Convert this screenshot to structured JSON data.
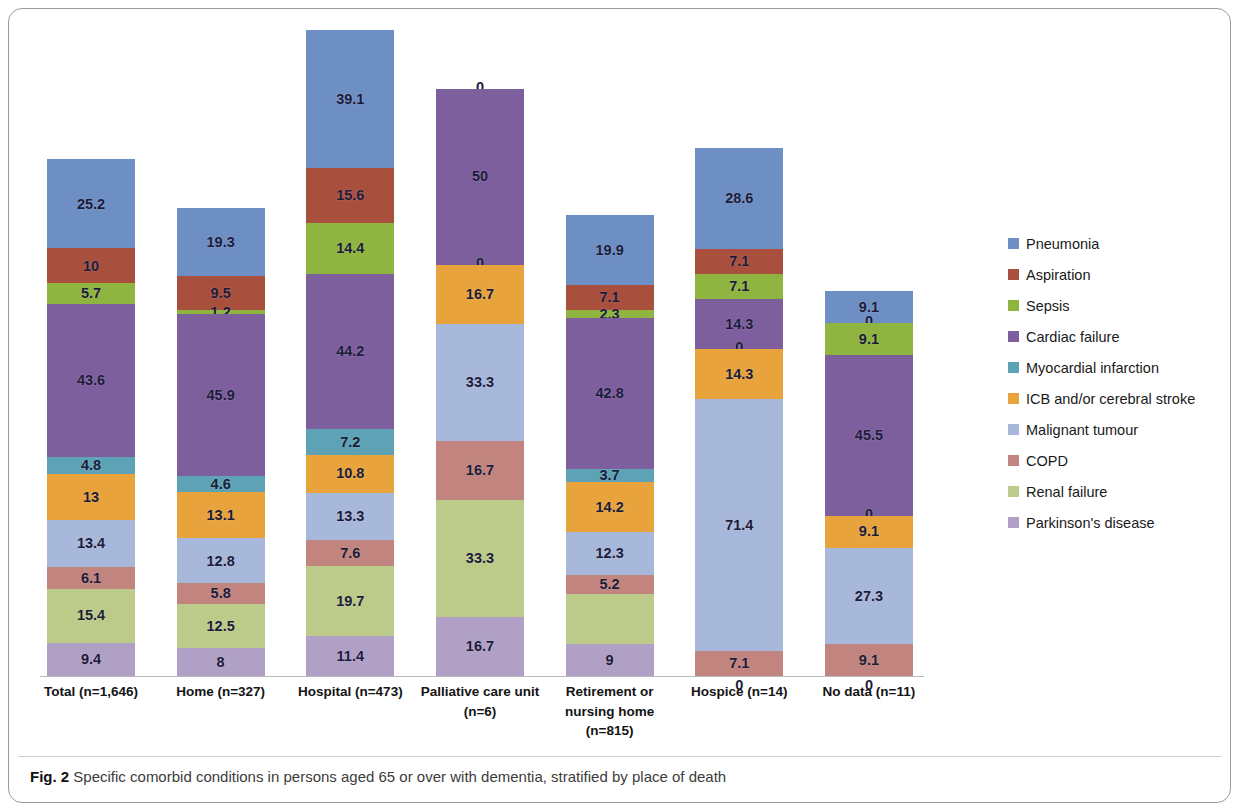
{
  "figure": {
    "caption_number": "Fig. 2",
    "caption_text": "Specific comorbid conditions in persons aged 65 or over with dementia, stratified by place of death"
  },
  "legend": {
    "position": "right",
    "items": [
      {
        "label": "Pneumonia",
        "color": "#6e8fc4"
      },
      {
        "label": "Aspiration",
        "color": "#a94f3e"
      },
      {
        "label": "Sepsis",
        "color": "#8fb440"
      },
      {
        "label": "Cardiac failure",
        "color": "#7d5f9e"
      },
      {
        "label": "Myocardial infarction",
        "color": "#5ea3b5"
      },
      {
        "label": "ICB and/or cerebral stroke",
        "color": "#e8a33d"
      },
      {
        "label": "Malignant tumour",
        "color": "#a8b8da"
      },
      {
        "label": "COPD",
        "color": "#c1847e"
      },
      {
        "label": "Renal failure",
        "color": "#bcca8a"
      },
      {
        "label": "Parkinson's disease",
        "color": "#b0a0c6"
      }
    ]
  },
  "chart_data": {
    "type": "bar",
    "subtype": "stacked-column",
    "title": "",
    "xlabel": "",
    "ylabel": "",
    "grid": false,
    "legend_position": "right",
    "categories": [
      "Total (n=1,646)",
      "Home (n=327)",
      "Hospital (n=473)",
      "Palliative care unit (n=6)",
      "Retirement or nursing home (n=815)",
      "Hospice (n=14)",
      "No data (n=11)"
    ],
    "category_lines": [
      [
        "Total (n=1,646)"
      ],
      [
        "Home (n=327)"
      ],
      [
        "Hospital (n=473)"
      ],
      [
        "Palliative care unit",
        "(n=6)"
      ],
      [
        "Retirement or",
        "nursing home",
        "(n=815)"
      ],
      [
        "Hospice (n=14)"
      ],
      [
        "No data (n=11)"
      ]
    ],
    "series": [
      {
        "name": "Pneumonia",
        "color": "#6e8fc4",
        "values": [
          25.2,
          19.3,
          39.1,
          0,
          19.9,
          28.6,
          9.1
        ]
      },
      {
        "name": "Aspiration",
        "color": "#a94f3e",
        "values": [
          10,
          9.5,
          15.6,
          0,
          7.1,
          7.1,
          0
        ]
      },
      {
        "name": "Sepsis",
        "color": "#8fb440",
        "values": [
          5.7,
          1.2,
          14.4,
          0,
          2.3,
          7.1,
          9.1
        ]
      },
      {
        "name": "Cardiac failure",
        "color": "#7d5f9e",
        "values": [
          43.6,
          45.9,
          44.2,
          50,
          42.8,
          14.3,
          45.5
        ]
      },
      {
        "name": "Myocardial infarction",
        "color": "#5ea3b5",
        "values": [
          4.8,
          4.6,
          7.2,
          0,
          3.7,
          0,
          0
        ]
      },
      {
        "name": "ICB and/or cerebral stroke",
        "color": "#e8a33d",
        "values": [
          13,
          13.1,
          10.8,
          16.7,
          14.2,
          14.3,
          9.1
        ]
      },
      {
        "name": "Malignant tumour",
        "color": "#a8b8da",
        "values": [
          13.4,
          12.8,
          13.3,
          33.3,
          12.3,
          71.4,
          27.3
        ]
      },
      {
        "name": "COPD",
        "color": "#c1847e",
        "values": [
          6.1,
          5.8,
          7.6,
          16.7,
          5.2,
          7.1,
          9.1
        ]
      },
      {
        "name": "Renal failure",
        "color": "#bcca8a",
        "values": [
          15.4,
          12.5,
          19.7,
          33.3,
          14.4,
          0,
          0
        ]
      },
      {
        "name": "Parkinson's disease",
        "color": "#b0a0c6",
        "values": [
          9.4,
          8,
          11.4,
          16.7,
          9,
          0,
          0
        ]
      }
    ],
    "bar_labels": [
      [
        "25.2",
        "10",
        "5.7",
        "43.6",
        "4.8",
        "13",
        "13.4",
        "6.1",
        "15.4",
        "9.4"
      ],
      [
        "19.3",
        "9.5",
        "1.2",
        "45.9",
        "4.6",
        "13.1",
        "12.8",
        "5.8",
        "12.5",
        "8"
      ],
      [
        "39.1",
        "15.6",
        "14.4",
        "44.2",
        "7.2",
        "10.8",
        "13.3",
        "7.6",
        "19.7",
        "11.4"
      ],
      [
        "0",
        "0",
        "0",
        "50",
        "0",
        "16.7",
        "33.3",
        "16.7",
        "33.3",
        "16.7"
      ],
      [
        "19.9",
        "7.1",
        "2.3",
        "42.8",
        "3.7",
        "14.2",
        "12.3",
        "5.2",
        "14.4",
        "9"
      ],
      [
        "28.6",
        "7.1",
        "7.1",
        "14.3",
        "0",
        "14.3",
        "71.4",
        "7.1",
        "0",
        "0"
      ],
      [
        "9.1",
        "0",
        "9.1",
        "45.5",
        "0",
        "9.1",
        "27.3",
        "9.1",
        "0",
        "0"
      ]
    ],
    "label_visible": [
      [
        true,
        true,
        true,
        true,
        true,
        true,
        true,
        true,
        true,
        true
      ],
      [
        true,
        true,
        true,
        true,
        true,
        true,
        true,
        true,
        true,
        true
      ],
      [
        true,
        true,
        true,
        true,
        true,
        true,
        true,
        true,
        true,
        true
      ],
      [
        true,
        false,
        false,
        true,
        true,
        true,
        true,
        true,
        true,
        true
      ],
      [
        true,
        true,
        true,
        true,
        true,
        true,
        true,
        true,
        false,
        true
      ],
      [
        true,
        true,
        true,
        true,
        true,
        true,
        true,
        true,
        true,
        false
      ],
      [
        true,
        true,
        true,
        true,
        true,
        true,
        true,
        true,
        true,
        false
      ]
    ]
  }
}
